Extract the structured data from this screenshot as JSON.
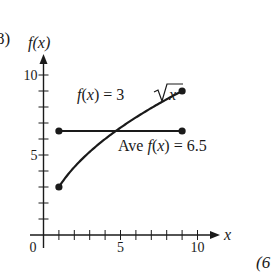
{
  "figure": {
    "part_label": "8)",
    "corner_label": "(6",
    "colors": {
      "ink": "#1a1a1a",
      "background": "#ffffff"
    }
  },
  "chart_data": {
    "type": "line",
    "title": "",
    "xlabel": "x",
    "ylabel": "f(x)",
    "xlim": [
      0,
      11.5
    ],
    "ylim": [
      0,
      11.5
    ],
    "x_ticks": [
      0,
      1,
      2,
      3,
      4,
      5,
      6,
      7,
      8,
      9,
      10
    ],
    "x_tick_labels": [
      {
        "value": 0,
        "label": "0"
      },
      {
        "value": 5,
        "label": "5"
      },
      {
        "value": 10,
        "label": "10"
      }
    ],
    "y_ticks": [
      1,
      2,
      3,
      4,
      5,
      6,
      7,
      8,
      9,
      10
    ],
    "y_tick_labels": [
      {
        "value": 5,
        "label": "5"
      },
      {
        "value": 10,
        "label": "10"
      }
    ],
    "grid": false,
    "series": [
      {
        "name": "f(x) = 3√x",
        "label_text": "f(x) = 3√x",
        "function": "3*sqrt(x)",
        "domain": [
          1,
          9
        ],
        "x": [
          1,
          2,
          3,
          4,
          5,
          6,
          7,
          8,
          9
        ],
        "values": [
          3,
          4.24,
          5.2,
          6,
          6.71,
          7.35,
          7.94,
          8.49,
          9
        ],
        "endpoints": [
          [
            1,
            3
          ],
          [
            9,
            9
          ]
        ]
      },
      {
        "name": "Ave f(x) = 6.5",
        "label_text": "Ave f(x) = 6.5",
        "x": [
          1,
          9
        ],
        "values": [
          6.5,
          6.5
        ],
        "endpoints": [
          [
            1,
            6.5
          ],
          [
            9,
            6.5
          ]
        ]
      }
    ],
    "annotations": [
      {
        "text": "f(x) = 3√x",
        "near": [
          4.5,
          9
        ]
      },
      {
        "text": "Ave f(x) = 6.5",
        "near": [
          6.5,
          5.5
        ]
      }
    ]
  }
}
